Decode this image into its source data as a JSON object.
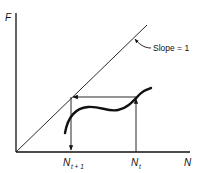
{
  "diagram": {
    "type": "cobweb-map",
    "axes": {
      "y_label": "F",
      "x_label": "N"
    },
    "reference_line": {
      "label": "Slope = 1"
    },
    "x_markers": {
      "n_t_plus_1": {
        "base": "N",
        "sub": "t + 1"
      },
      "n_t": {
        "base": "N",
        "sub": "t"
      }
    },
    "colors": {
      "ink": "#111111",
      "background": "#ffffff"
    }
  }
}
